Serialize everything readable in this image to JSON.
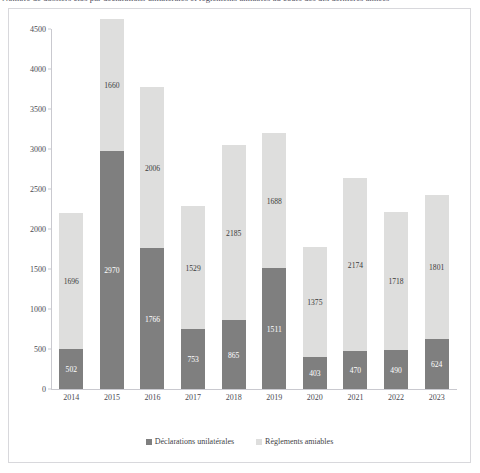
{
  "caption": {
    "text": "Nombre de dossiers clos par déclarations unilatérales et règlements amiables au cours des dix dernières années"
  },
  "legend": {
    "items": [
      {
        "label": "Déclarations unilatérales",
        "color": "#7f7f7f",
        "swatch": "dark"
      },
      {
        "label": "Règlements amiables",
        "color": "#dededd",
        "swatch": "light"
      }
    ]
  },
  "chart_data": {
    "type": "bar",
    "subtype": "stacked-column",
    "title": "Nombre de dossiers clos par déclarations unilatérales et règlements amiables au cours des dix dernières années",
    "xlabel": "",
    "ylabel": "",
    "ylim": [
      0,
      4500
    ],
    "ytick_step": 500,
    "yticks": [
      4500,
      4000,
      3500,
      3000,
      2500,
      2000,
      1500,
      1000,
      500,
      0
    ],
    "grid": false,
    "legend_position": "bottom",
    "categories": [
      "2014",
      "2015",
      "2016",
      "2017",
      "2018",
      "2019",
      "2020",
      "2021",
      "2022",
      "2023"
    ],
    "series": [
      {
        "name": "Déclarations unilatérales",
        "color": "#7f7f7f",
        "values": [
          502,
          2970,
          1766,
          753,
          865,
          1511,
          403,
          470,
          490,
          624
        ]
      },
      {
        "name": "Règlements amiables",
        "color": "#dededd",
        "values": [
          1696,
          1660,
          2006,
          1529,
          2185,
          1688,
          1375,
          2174,
          1718,
          1801
        ]
      }
    ],
    "totals": [
      2198,
      4630,
      3772,
      2282,
      3050,
      3199,
      1778,
      2644,
      2208,
      2425
    ]
  }
}
